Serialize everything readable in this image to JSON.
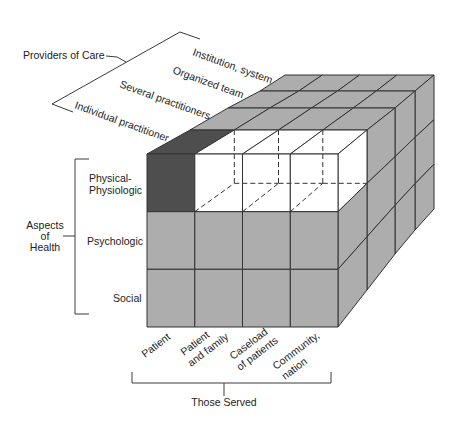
{
  "figure": {
    "providers_of_care": {
      "title": "Providers of Care",
      "levels": [
        "Individual practitioner",
        "Several practitioners",
        "Organized team",
        "Institution, system"
      ]
    },
    "aspects_of_health": {
      "title_lines": [
        "Aspects",
        "of",
        "Health"
      ],
      "levels": [
        {
          "lines": [
            "Physical-",
            "Physiologic"
          ]
        },
        {
          "lines": [
            "Psychologic"
          ]
        },
        {
          "lines": [
            "Social"
          ]
        }
      ]
    },
    "those_served": {
      "title": "Those Served",
      "levels": [
        {
          "lines": [
            "Patient"
          ]
        },
        {
          "lines": [
            "Patient",
            "and family"
          ]
        },
        {
          "lines": [
            "Caseload",
            "of patients"
          ]
        },
        {
          "lines": [
            "Community,",
            "nation"
          ]
        }
      ]
    },
    "cube": {
      "columns_axis": "those_served",
      "rows_axis": "aspects_of_health",
      "layers_axis": "providers_of_care",
      "highlighted_cells": [
        {
          "served": 0,
          "health": 0,
          "provider": 0
        }
      ],
      "cutaway_cells": [
        {
          "served": 1,
          "health": 0,
          "provider": 0
        },
        {
          "served": 2,
          "health": 0,
          "provider": 0
        },
        {
          "served": 3,
          "health": 0,
          "provider": 0
        }
      ]
    },
    "colors": {
      "cell_fill": "#adadad",
      "highlight_fill": "#4e4e4e",
      "cutaway_fill": "#ffffff",
      "edge": "#333333"
    }
  }
}
